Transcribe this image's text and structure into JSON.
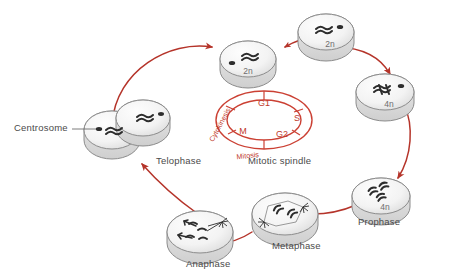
{
  "figure": {
    "type": "cell-cycle-diagram",
    "background_color": "#ffffff",
    "arrow_color": "#b5342a",
    "ring_color": "#cb4033",
    "cell_fill": "#f2f2f2",
    "cell_outline": "#8c8c8c",
    "label_color": "#4a4a4a"
  },
  "ring": {
    "name": "cell-cycle-ring",
    "phases": [
      {
        "key": "g1",
        "label": "G1",
        "position": "top"
      },
      {
        "key": "s",
        "label": "S",
        "position": "right"
      },
      {
        "key": "g2",
        "label": "G2",
        "position": "bottom-right"
      },
      {
        "key": "m",
        "label": "M",
        "position": "left"
      }
    ],
    "arc_labels": [
      {
        "key": "cytokinesis",
        "label": "Cytokinesis",
        "position": "upper-left-arc"
      },
      {
        "key": "mitosis",
        "label": "Mitosis",
        "position": "bottom-arc"
      }
    ]
  },
  "callouts": {
    "centrosome": "Centrosome",
    "mitotic_spindle": "Mitotic spindle"
  },
  "stages": [
    {
      "key": "telophase",
      "label": "Telophase",
      "ploidy": ""
    },
    {
      "key": "interphase_1",
      "label": "",
      "ploidy": "2n"
    },
    {
      "key": "interphase_2",
      "label": "",
      "ploidy": "2n"
    },
    {
      "key": "s_phase_done",
      "label": "",
      "ploidy": "4n"
    },
    {
      "key": "prophase",
      "label": "Prophase",
      "ploidy": "4n"
    },
    {
      "key": "metaphase",
      "label": "Metaphase",
      "ploidy": ""
    },
    {
      "key": "anaphase",
      "label": "Anaphase",
      "ploidy": ""
    }
  ],
  "ploidy_labels": {
    "cell_a": "2n",
    "cell_b": "2n",
    "cell_c": "4n",
    "cell_d": "4n"
  },
  "stage_labels": {
    "telophase": "Telophase",
    "prophase": "Prophase",
    "metaphase": "Metaphase",
    "anaphase": "Anaphase"
  }
}
